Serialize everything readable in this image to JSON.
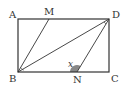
{
  "diagram": {
    "type": "geometry",
    "shape": "rectangle ABCD with segments BM, BD, DN",
    "points": {
      "A": {
        "label": "A",
        "x": 18,
        "y": 19
      },
      "M": {
        "label": "M",
        "x": 49,
        "y": 19
      },
      "D": {
        "label": "D",
        "x": 109,
        "y": 19
      },
      "B": {
        "label": "B",
        "x": 18,
        "y": 72
      },
      "N": {
        "label": "N",
        "x": 77,
        "y": 72
      },
      "C": {
        "label": "C",
        "x": 109,
        "y": 72
      }
    },
    "angle_label": "x",
    "colors": {
      "stroke": "#333333",
      "shade": "#888888"
    }
  }
}
